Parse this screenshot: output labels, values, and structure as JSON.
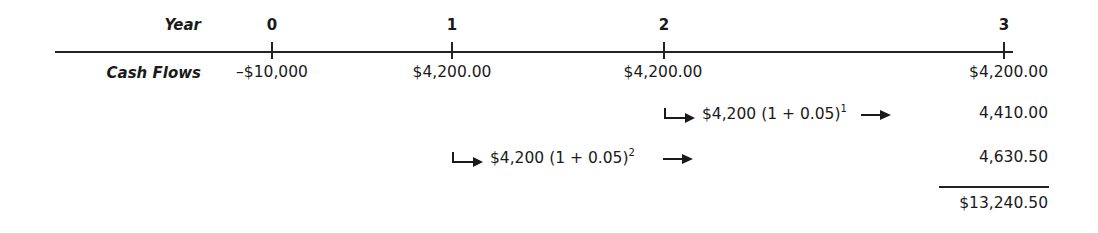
{
  "timeline": {
    "year_label": "Year",
    "cash_flows_label": "Cash Flows",
    "years": [
      "0",
      "1",
      "2",
      "3"
    ],
    "cash_flows": [
      "–$10,000",
      "$4,200.00",
      "$4,200.00",
      "$4,200.00"
    ]
  },
  "compounding": [
    {
      "principal": "$4,200",
      "factor": "(1 + 0.05)",
      "exponent": "1",
      "result": "4,410.00"
    },
    {
      "principal": "$4,200",
      "factor": "(1 + 0.05)",
      "exponent": "2",
      "result": "4,630.50"
    }
  ],
  "total": "$13,240.50"
}
